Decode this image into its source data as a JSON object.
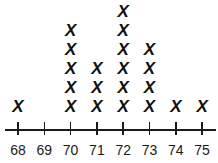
{
  "chart_data": {
    "type": "line plot (dot plot with X marks)",
    "title": "",
    "xlabel": "",
    "ylabel": "",
    "marker": "X",
    "categories": [
      "68",
      "69",
      "70",
      "71",
      "72",
      "73",
      "74",
      "75"
    ],
    "values": [
      1,
      0,
      5,
      3,
      6,
      4,
      1,
      1
    ],
    "xlim": [
      68,
      75
    ],
    "grid": false,
    "legend": null
  },
  "colors": {
    "ink": "#111111",
    "background": "#ffffff"
  }
}
